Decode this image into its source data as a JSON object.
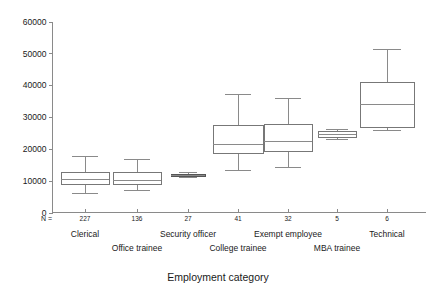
{
  "chart_data": {
    "type": "box",
    "title": "",
    "xlabel": "Employment category",
    "ylabel": "",
    "ylim": [
      0,
      60000
    ],
    "ytick_labels": [
      "0",
      "10000",
      "20000",
      "30000",
      "40000",
      "50000",
      "60000"
    ],
    "ytick_values": [
      0,
      10000,
      20000,
      30000,
      40000,
      50000,
      60000
    ],
    "grid": false,
    "legend": "none",
    "n_row_header": "N =",
    "categories": [
      "Clerical",
      "Office trainee",
      "Security officer",
      "College trainee",
      "Exempt employee",
      "MBA trainee",
      "Technical"
    ],
    "counts": [
      227,
      136,
      27,
      41,
      32,
      5,
      6
    ],
    "boxes": [
      {
        "category": "Clerical",
        "n": 227,
        "whisker_low": 6000,
        "q1": 9000,
        "median": 10500,
        "q3": 12600,
        "whisker_high": 17800
      },
      {
        "category": "Office trainee",
        "n": 136,
        "whisker_low": 7000,
        "q1": 9100,
        "median": 10200,
        "q3": 12600,
        "whisker_high": 16700
      },
      {
        "category": "Security officer",
        "n": 27,
        "whisker_low": 11000,
        "q1": 11600,
        "median": 11800,
        "q3": 12100,
        "whisker_high": 12700
      },
      {
        "category": "College trainee",
        "n": 41,
        "whisker_low": 13200,
        "q1": 18600,
        "median": 21600,
        "q3": 27600,
        "whisker_high": 37200
      },
      {
        "category": "Exempt employee",
        "n": 32,
        "whisker_low": 14400,
        "q1": 19300,
        "median": 22500,
        "q3": 27800,
        "whisker_high": 36000
      },
      {
        "category": "MBA trainee",
        "n": 5,
        "whisker_low": 23000,
        "q1": 23800,
        "median": 24800,
        "q3": 25600,
        "whisker_high": 26200
      },
      {
        "category": "Technical",
        "n": 6,
        "whisker_low": 26000,
        "q1": 27000,
        "median": 34000,
        "q3": 41000,
        "whisker_high": 51500
      }
    ],
    "colors": {
      "axis": "#8a8a8a",
      "box_stroke": "#777777",
      "box_fill": "#ffffff",
      "flat_box_fill": "#8f8f8f",
      "text": "#1a1a1a",
      "background": "#ffffff"
    }
  }
}
